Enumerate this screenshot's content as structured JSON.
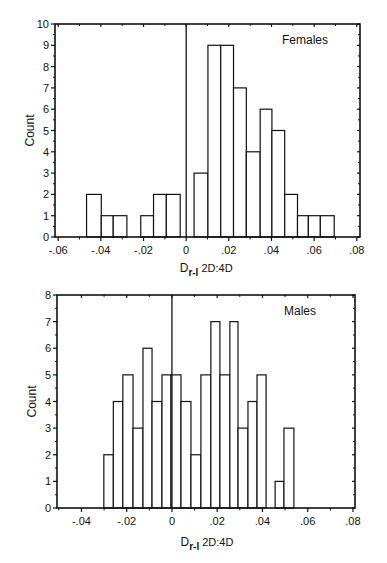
{
  "chart_data": [
    {
      "type": "bar",
      "subtype": "histogram",
      "title": "Females",
      "xlabel": "D r-l 2D:4D",
      "xlabel_main": "D",
      "xlabel_sub": "r-l",
      "xlabel_rest": " 2D:4D",
      "ylabel": "Count",
      "xlim": [
        -0.0615,
        0.0815
      ],
      "ylim": [
        0,
        10
      ],
      "x_ticks": [
        -0.06,
        -0.04,
        -0.02,
        0,
        0.02,
        0.04,
        0.06,
        0.08
      ],
      "x_tick_labels": [
        "-.06",
        "-.04",
        "-.02",
        "0",
        ".02",
        ".04",
        ".06",
        ".08"
      ],
      "y_ticks": [
        0,
        1,
        2,
        3,
        4,
        5,
        6,
        7,
        8,
        9,
        10
      ],
      "y_tick_labels": [
        "0",
        "1",
        "2",
        "3",
        "4",
        "5",
        "6",
        "7",
        "8",
        "9",
        "10"
      ],
      "zero_line": 0,
      "grid": false,
      "legend_position": "top-right label",
      "bins": [
        {
          "x0": -0.0467,
          "x1": -0.0398,
          "count": 2
        },
        {
          "x0": -0.0398,
          "x1": -0.0342,
          "count": 1
        },
        {
          "x0": -0.0342,
          "x1": -0.0278,
          "count": 1
        },
        {
          "x0": -0.0213,
          "x1": -0.0153,
          "count": 1
        },
        {
          "x0": -0.0153,
          "x1": -0.0093,
          "count": 2
        },
        {
          "x0": -0.0093,
          "x1": -0.0028,
          "count": 2
        },
        {
          "x0": 0.0037,
          "x1": 0.0102,
          "count": 3
        },
        {
          "x0": 0.0102,
          "x1": 0.0162,
          "count": 9
        },
        {
          "x0": 0.0162,
          "x1": 0.0222,
          "count": 9
        },
        {
          "x0": 0.0222,
          "x1": 0.0282,
          "count": 7
        },
        {
          "x0": 0.0282,
          "x1": 0.0347,
          "count": 4
        },
        {
          "x0": 0.0347,
          "x1": 0.0402,
          "count": 6
        },
        {
          "x0": 0.0402,
          "x1": 0.0462,
          "count": 5
        },
        {
          "x0": 0.0462,
          "x1": 0.0522,
          "count": 2
        },
        {
          "x0": 0.0522,
          "x1": 0.0573,
          "count": 1
        },
        {
          "x0": 0.0573,
          "x1": 0.0629,
          "count": 1
        },
        {
          "x0": 0.0629,
          "x1": 0.0694,
          "count": 1
        }
      ]
    },
    {
      "type": "bar",
      "subtype": "histogram",
      "title": "Males",
      "xlabel": "D r-l 2D:4D",
      "xlabel_main": "D",
      "xlabel_sub": "r-l",
      "xlabel_rest": " 2D:4D",
      "ylabel": "Count",
      "xlim": [
        -0.0508,
        0.0809
      ],
      "ylim": [
        0,
        8
      ],
      "x_ticks": [
        -0.04,
        -0.02,
        0,
        0.02,
        0.04,
        0.06,
        0.08
      ],
      "x_tick_labels": [
        "-.04",
        "-.02",
        "0",
        ".02",
        ".04",
        ".06",
        ".08"
      ],
      "y_ticks": [
        0,
        1,
        2,
        3,
        4,
        5,
        6,
        7,
        8
      ],
      "y_tick_labels": [
        "0",
        "1",
        "2",
        "3",
        "4",
        "5",
        "6",
        "7",
        "8"
      ],
      "zero_line": 0,
      "grid": false,
      "legend_position": "top-right label",
      "bins": [
        {
          "x0": -0.0301,
          "x1": -0.0259,
          "count": 2
        },
        {
          "x0": -0.0259,
          "x1": -0.0217,
          "count": 4
        },
        {
          "x0": -0.0217,
          "x1": -0.0172,
          "count": 5
        },
        {
          "x0": -0.0172,
          "x1": -0.0128,
          "count": 3
        },
        {
          "x0": -0.0128,
          "x1": -0.0088,
          "count": 6
        },
        {
          "x0": -0.0088,
          "x1": -0.0044,
          "count": 4
        },
        {
          "x0": -0.0044,
          "x1": -0.0004,
          "count": 5
        },
        {
          "x0": -0.0004,
          "x1": 0.004,
          "count": 5
        },
        {
          "x0": 0.004,
          "x1": 0.0084,
          "count": 4
        },
        {
          "x0": 0.0084,
          "x1": 0.0128,
          "count": 2
        },
        {
          "x0": 0.0128,
          "x1": 0.0172,
          "count": 5
        },
        {
          "x0": 0.0172,
          "x1": 0.0212,
          "count": 7
        },
        {
          "x0": 0.0212,
          "x1": 0.0256,
          "count": 5
        },
        {
          "x0": 0.0256,
          "x1": 0.0292,
          "count": 7
        },
        {
          "x0": 0.0292,
          "x1": 0.0336,
          "count": 3
        },
        {
          "x0": 0.0336,
          "x1": 0.0376,
          "count": 4
        },
        {
          "x0": 0.0376,
          "x1": 0.0416,
          "count": 5
        },
        {
          "x0": 0.0456,
          "x1": 0.0495,
          "count": 1
        },
        {
          "x0": 0.0495,
          "x1": 0.0539,
          "count": 3
        }
      ]
    }
  ],
  "layout": {
    "panels": [
      {
        "left": 55,
        "right": 360,
        "top": 24,
        "bottom": 237,
        "xlabel_y": 272,
        "ylabel_x": 30
      },
      {
        "left": 57,
        "right": 355,
        "top": 295,
        "bottom": 508,
        "xlabel_y": 546,
        "ylabel_x": 32
      }
    ],
    "colors": {
      "axis": "#111111",
      "bar_fill": "#ffffff",
      "bar_stroke": "#111111"
    }
  }
}
